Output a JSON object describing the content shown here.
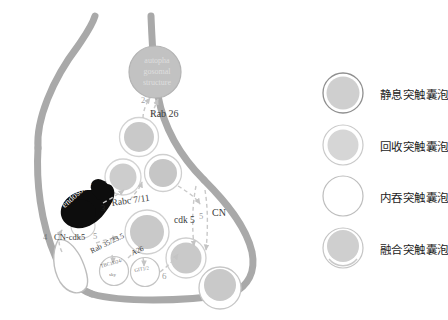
{
  "diagram": {
    "organelles": {
      "autophagosome_label": "autopha\ngosomal\nstructure",
      "autophagosome_line1": "autopha",
      "autophagosome_line2": "gosomal",
      "autophagosome_line3": "structure",
      "endosome_label": "endosome"
    },
    "annotations": [
      {
        "id": "step-2",
        "text": "2",
        "x": 141,
        "y": 100
      },
      {
        "id": "rab26",
        "text": "Rab 26",
        "x": 150,
        "y": 114
      },
      {
        "id": "step-3",
        "text": "3",
        "x": 103,
        "y": 208
      },
      {
        "id": "rab-7-11",
        "text": "Rabc 7/11",
        "x": 113,
        "y": 205
      },
      {
        "id": "cdk5",
        "text": "cdk 5",
        "x": 175,
        "y": 222
      },
      {
        "id": "cn",
        "text": "CN",
        "x": 212,
        "y": 213
      },
      {
        "id": "step-5b",
        "text": "5",
        "x": 198,
        "y": 218
      },
      {
        "id": "step-4",
        "text": "4",
        "x": 44,
        "y": 238
      },
      {
        "id": "cn-cdk5",
        "text": "CN-cdk5",
        "x": 55,
        "y": 238
      },
      {
        "id": "step-5a",
        "text": "5",
        "x": 93,
        "y": 236
      },
      {
        "id": "rab-35-23-5",
        "text": "Rab 35/23.5",
        "x": 92,
        "y": 251
      },
      {
        "id": "a26",
        "text": "A26",
        "x": 131,
        "y": 253
      },
      {
        "id": "tbc1d24",
        "text": "TBC1D24/",
        "x": 103,
        "y": 266
      },
      {
        "id": "tbc1d24-2",
        "text": "sky",
        "x": 110,
        "y": 274
      },
      {
        "id": "git12",
        "text": "GIT1/2",
        "x": 136,
        "y": 270
      },
      {
        "id": "step-6",
        "text": "6",
        "x": 162,
        "y": 277
      }
    ]
  },
  "legend": {
    "items": [
      {
        "id": "resting-vesicle",
        "label": "静息突触囊泡",
        "style": "filled-outlined",
        "fill": "#cfcfcf",
        "stroke": "#8f8f8f"
      },
      {
        "id": "recycling-vesicle",
        "label": "回收突触囊泡",
        "style": "filled-light",
        "fill": "#d8d8d8",
        "stroke": "#b5b5b5"
      },
      {
        "id": "endocytic-vesicle",
        "label": "内吞突触囊泡",
        "style": "empty",
        "fill": "#ffffff",
        "stroke": "#b9b9b9"
      },
      {
        "id": "fusing-vesicle",
        "label": "融合突触囊泡",
        "style": "filled-open",
        "fill": "#cfcfcf",
        "stroke": "#b0b0b0"
      }
    ]
  },
  "colors": {
    "membrane": "#a9a9a9",
    "vesicle_fill": "#c9c9c9",
    "vesicle_ring": "#e3e3e3",
    "endosome": "#0d0d0d",
    "autophagosome": "#c2c2c2",
    "arrow": "#c4c4c4",
    "text": "#3a3a3a",
    "background": "#ffffff"
  }
}
